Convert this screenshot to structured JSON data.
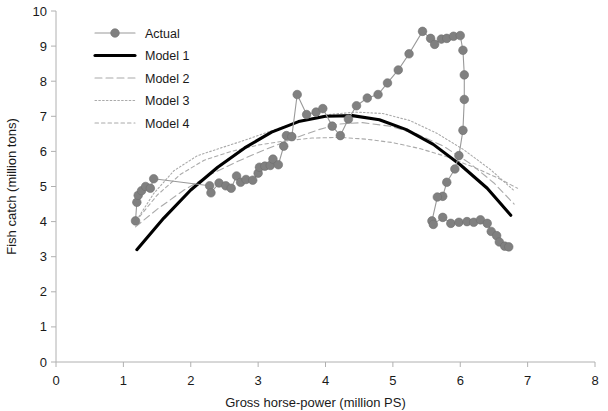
{
  "chart_data": {
    "type": "line",
    "title": "",
    "xlabel": "Gross horse-power (million PS)",
    "ylabel": "Fish catch (million tons)",
    "xlim": [
      0,
      8
    ],
    "ylim": [
      0,
      10
    ],
    "xticks": [
      "0",
      "1",
      "2",
      "3",
      "4",
      "5",
      "6",
      "7",
      "8"
    ],
    "yticks": [
      "0",
      "1",
      "2",
      "3",
      "4",
      "5",
      "6",
      "7",
      "8",
      "9",
      "10"
    ],
    "grid": false,
    "legend_position": "upper-left",
    "marker_color": "#808080",
    "line_color": "#999999",
    "model1_color": "#000000",
    "model_color": "#aaaaaa",
    "axis_color": "#b0b0b0",
    "series": [
      {
        "name": "Actual",
        "style": "line-markers",
        "points": [
          [
            1.18,
            4.02
          ],
          [
            1.2,
            4.55
          ],
          [
            1.22,
            4.75
          ],
          [
            1.27,
            4.88
          ],
          [
            1.33,
            5.0
          ],
          [
            1.4,
            4.95
          ],
          [
            1.45,
            5.22
          ],
          [
            2.28,
            5.02
          ],
          [
            2.3,
            4.82
          ],
          [
            2.42,
            5.1
          ],
          [
            2.52,
            5.02
          ],
          [
            2.6,
            4.95
          ],
          [
            2.68,
            5.3
          ],
          [
            2.74,
            5.12
          ],
          [
            2.82,
            5.2
          ],
          [
            2.92,
            5.18
          ],
          [
            3.0,
            5.38
          ],
          [
            3.02,
            5.55
          ],
          [
            3.1,
            5.58
          ],
          [
            3.18,
            5.6
          ],
          [
            3.22,
            5.78
          ],
          [
            3.3,
            5.62
          ],
          [
            3.38,
            6.15
          ],
          [
            3.42,
            6.45
          ],
          [
            3.5,
            6.42
          ],
          [
            3.58,
            7.62
          ],
          [
            3.72,
            7.05
          ],
          [
            3.86,
            7.12
          ],
          [
            3.96,
            7.22
          ],
          [
            4.1,
            6.72
          ],
          [
            4.22,
            6.45
          ],
          [
            4.34,
            6.92
          ],
          [
            4.46,
            7.3
          ],
          [
            4.62,
            7.52
          ],
          [
            4.78,
            7.62
          ],
          [
            4.92,
            7.95
          ],
          [
            5.08,
            8.32
          ],
          [
            5.24,
            8.78
          ],
          [
            5.44,
            9.42
          ],
          [
            5.56,
            9.22
          ],
          [
            5.62,
            9.05
          ],
          [
            5.72,
            9.2
          ],
          [
            5.8,
            9.22
          ],
          [
            5.9,
            9.28
          ],
          [
            6.0,
            9.3
          ],
          [
            6.04,
            8.88
          ],
          [
            6.06,
            8.18
          ],
          [
            6.06,
            7.48
          ],
          [
            6.04,
            6.6
          ],
          [
            5.98,
            5.88
          ],
          [
            5.92,
            5.5
          ],
          [
            5.8,
            5.12
          ],
          [
            5.74,
            4.72
          ],
          [
            5.66,
            4.7
          ],
          [
            5.58,
            4.02
          ],
          [
            5.6,
            3.92
          ],
          [
            5.74,
            4.12
          ],
          [
            5.86,
            3.95
          ],
          [
            5.98,
            3.98
          ],
          [
            6.1,
            4.0
          ],
          [
            6.2,
            3.98
          ],
          [
            6.3,
            4.05
          ],
          [
            6.4,
            3.95
          ],
          [
            6.46,
            3.72
          ],
          [
            6.54,
            3.6
          ],
          [
            6.58,
            3.42
          ],
          [
            6.66,
            3.3
          ],
          [
            6.72,
            3.28
          ]
        ]
      },
      {
        "name": "Model 1",
        "style": "thick-solid",
        "points": [
          [
            1.2,
            3.2
          ],
          [
            1.6,
            4.1
          ],
          [
            2.0,
            4.9
          ],
          [
            2.4,
            5.55
          ],
          [
            2.8,
            6.1
          ],
          [
            3.2,
            6.55
          ],
          [
            3.6,
            6.85
          ],
          [
            4.0,
            7.0
          ],
          [
            4.4,
            7.02
          ],
          [
            4.8,
            6.9
          ],
          [
            5.2,
            6.62
          ],
          [
            5.6,
            6.2
          ],
          [
            6.0,
            5.62
          ],
          [
            6.4,
            4.95
          ],
          [
            6.75,
            4.18
          ]
        ]
      },
      {
        "name": "Model 2",
        "style": "dashed",
        "points": [
          [
            1.18,
            3.85
          ],
          [
            1.5,
            4.35
          ],
          [
            1.9,
            4.9
          ],
          [
            2.3,
            5.35
          ],
          [
            2.7,
            5.72
          ],
          [
            3.1,
            6.05
          ],
          [
            3.5,
            6.35
          ],
          [
            3.9,
            6.62
          ],
          [
            4.2,
            6.78
          ],
          [
            4.55,
            6.82
          ],
          [
            4.95,
            6.72
          ],
          [
            5.35,
            6.5
          ],
          [
            5.75,
            6.15
          ],
          [
            6.15,
            5.65
          ],
          [
            6.5,
            5.1
          ],
          [
            6.8,
            4.5
          ]
        ]
      },
      {
        "name": "Model 3",
        "style": "dotted",
        "points": [
          [
            1.2,
            4.05
          ],
          [
            1.45,
            4.8
          ],
          [
            1.75,
            5.45
          ],
          [
            2.1,
            5.88
          ],
          [
            2.45,
            6.1
          ],
          [
            2.85,
            6.35
          ],
          [
            3.25,
            6.62
          ],
          [
            3.65,
            6.88
          ],
          [
            4.05,
            7.05
          ],
          [
            4.45,
            7.12
          ],
          [
            4.85,
            7.08
          ],
          [
            5.25,
            6.88
          ],
          [
            5.65,
            6.52
          ],
          [
            6.05,
            6.05
          ],
          [
            6.45,
            5.48
          ],
          [
            6.8,
            4.88
          ]
        ]
      },
      {
        "name": "Model 4",
        "style": "fine-dashed",
        "points": [
          [
            1.18,
            4.0
          ],
          [
            1.5,
            4.75
          ],
          [
            1.85,
            5.35
          ],
          [
            2.2,
            5.75
          ],
          [
            2.6,
            6.0
          ],
          [
            3.0,
            6.18
          ],
          [
            3.4,
            6.3
          ],
          [
            3.8,
            6.38
          ],
          [
            4.2,
            6.4
          ],
          [
            4.6,
            6.35
          ],
          [
            5.0,
            6.25
          ],
          [
            5.4,
            6.08
          ],
          [
            5.8,
            5.85
          ],
          [
            6.2,
            5.55
          ],
          [
            6.55,
            5.25
          ],
          [
            6.85,
            4.95
          ]
        ]
      }
    ],
    "legend": [
      {
        "label": "Actual",
        "style": "line-markers"
      },
      {
        "label": "Model 1",
        "style": "thick-solid"
      },
      {
        "label": "Model 2",
        "style": "dashed"
      },
      {
        "label": "Model 3",
        "style": "dotted"
      },
      {
        "label": "Model 4",
        "style": "fine-dashed"
      }
    ]
  }
}
